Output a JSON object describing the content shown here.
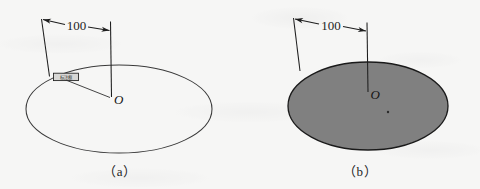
{
  "figure": {
    "background_color": "#f6f6f5",
    "ink_color": "#1d1d1d",
    "fill_color": "#808080",
    "panels": [
      {
        "id": "a",
        "caption": "（a）",
        "dimension_value": "100",
        "center_label": "O",
        "tag_label": "标注框",
        "ellipse_fill": "none",
        "ellipse_stroke": "#3a3a3a"
      },
      {
        "id": "b",
        "caption": "（b）",
        "dimension_value": "100",
        "center_label": "O",
        "ellipse_fill": "#808080",
        "ellipse_stroke": "#1a1a1a"
      }
    ]
  }
}
